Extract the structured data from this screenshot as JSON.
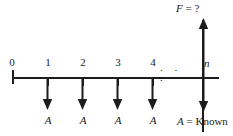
{
  "diagram": {
    "type": "cash-flow-timeline",
    "axis": {
      "orientation": "horizontal",
      "start_x": 12,
      "end_x": 219,
      "y": 77,
      "tick_spacing_px": 35,
      "color": "#1c1c1c"
    },
    "ticks": [
      {
        "label": "0",
        "x": 12,
        "kind": "origin",
        "italic": false
      },
      {
        "label": "1",
        "x": 47,
        "kind": "minor",
        "italic": false
      },
      {
        "label": "2",
        "x": 82,
        "kind": "minor",
        "italic": false
      },
      {
        "label": "3",
        "x": 117,
        "kind": "minor",
        "italic": false
      },
      {
        "label": "4",
        "x": 152,
        "kind": "minor",
        "italic": false
      },
      {
        "label": "n",
        "x": 203,
        "kind": "period-n",
        "italic": true
      }
    ],
    "ellipsis": ". . .",
    "down_arrows": [
      {
        "x": 47,
        "label": "A",
        "period": "1"
      },
      {
        "x": 82,
        "label": "A",
        "period": "2"
      },
      {
        "x": 117,
        "label": "A",
        "period": "3"
      },
      {
        "x": 152,
        "label": "A",
        "period": "4"
      },
      {
        "x": 203,
        "label": "",
        "period": "n"
      }
    ],
    "up_arrow": {
      "x": 203,
      "symbol": "F",
      "equals": " = ",
      "value": "?",
      "full_label": "F = ?"
    },
    "legend": {
      "symbol": "A",
      "equals": " = ",
      "value": "Known",
      "full_label": "A = Known"
    },
    "colors": {
      "ink": "#1c1c1c",
      "background": "#ffffff"
    }
  }
}
